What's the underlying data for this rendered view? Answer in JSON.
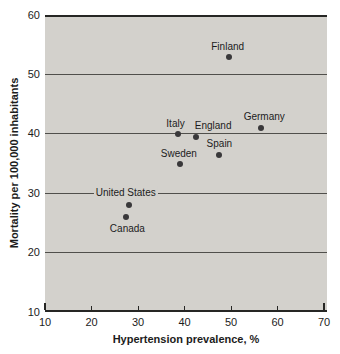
{
  "chart_data": {
    "type": "scatter",
    "title": "",
    "xlabel": "Hypertension prevalence, %",
    "ylabel": "Mortality per 100,000 inhabitants",
    "xlim": [
      10,
      70
    ],
    "ylim": [
      10,
      60
    ],
    "x_ticks": [
      10,
      20,
      30,
      40,
      50,
      60,
      70
    ],
    "y_ticks": [
      60,
      50,
      40,
      30,
      20,
      10
    ],
    "grid": "horizontal-only",
    "legend": "none",
    "points": [
      {
        "label": "Finland",
        "x": 49.5,
        "y": 53,
        "label_dx": -1,
        "label_dy": -11
      },
      {
        "label": "Germany",
        "x": 56.5,
        "y": 41,
        "label_dx": 3,
        "label_dy": -12
      },
      {
        "label": "Italy",
        "x": 38.5,
        "y": 40,
        "label_dx": -2,
        "label_dy": -11
      },
      {
        "label": "England",
        "x": 42.5,
        "y": 39.5,
        "label_dx": 17,
        "label_dy": -12
      },
      {
        "label": "Spain",
        "x": 47.5,
        "y": 36.5,
        "label_dx": 0,
        "label_dy": -12
      },
      {
        "label": "Sweden",
        "x": 39,
        "y": 35,
        "label_dx": -1,
        "label_dy": -11
      },
      {
        "label": "United States",
        "x": 28,
        "y": 28,
        "label_dx": -3,
        "label_dy": -13
      },
      {
        "label": "Canada",
        "x": 27.5,
        "y": 26,
        "label_dx": 1,
        "label_dy": 11
      }
    ],
    "colors": {
      "plot_bg": "#d3d1cc",
      "grid": "#504f4b",
      "axis": "#262624",
      "dot": "#39383a",
      "text": "#1c1c1c"
    }
  }
}
